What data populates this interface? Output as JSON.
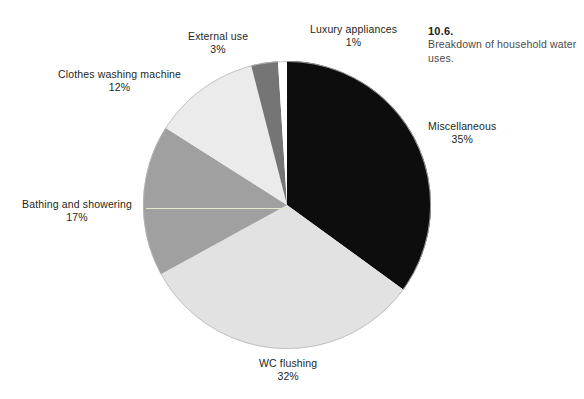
{
  "caption": {
    "number": "10.6.",
    "text": "Breakdown of household water uses."
  },
  "chart_data": {
    "type": "pie",
    "title": "Breakdown of household water uses.",
    "xlabel": "",
    "ylabel": "",
    "unit": "%",
    "total": 100,
    "start_angle_deg": 0,
    "direction": "clockwise",
    "legend_position": "none",
    "grid": false,
    "categories": [
      "Miscellaneous",
      "WC flushing",
      "Bathing and showering",
      "Clothes washing machine",
      "External use",
      "Luxury appliances"
    ],
    "values": [
      35,
      32,
      17,
      12,
      3,
      1
    ],
    "colors": [
      "#0d0d0d",
      "#e2e2e2",
      "#a0a0a0",
      "#ebebeb",
      "#757575",
      "#ffffff"
    ],
    "slices": [
      {
        "label": "Miscellaneous",
        "value": 35,
        "value_text": "35%",
        "color": "#0d0d0d",
        "start_deg": 0,
        "end_deg": 126
      },
      {
        "label": "WC flushing",
        "value": 32,
        "value_text": "32%",
        "color": "#e2e2e2",
        "start_deg": 126,
        "end_deg": 241.2
      },
      {
        "label": "Bathing and showering",
        "value": 17,
        "value_text": "17%",
        "color": "#a0a0a0",
        "start_deg": 241.2,
        "end_deg": 302.4
      },
      {
        "label": "Clothes washing machine",
        "value": 12,
        "value_text": "12%",
        "color": "#ebebeb",
        "start_deg": 302.4,
        "end_deg": 345.6
      },
      {
        "label": "External use",
        "value": 3,
        "value_text": "3%",
        "color": "#757575",
        "start_deg": 345.6,
        "end_deg": 356.4
      },
      {
        "label": "Luxury appliances",
        "value": 1,
        "value_text": "1%",
        "color": "#ffffff",
        "start_deg": 356.4,
        "end_deg": 360
      }
    ]
  },
  "labels": {
    "luxury_appliances": {
      "name": "Luxury appliances",
      "pct": "1%"
    },
    "external_use": {
      "name": "External use",
      "pct": "3%"
    },
    "clothes_washing_machine": {
      "name": "Clothes washing machine",
      "pct": "12%"
    },
    "bathing_and_showering": {
      "name": "Bathing and showering",
      "pct": "17%"
    },
    "wc_flushing": {
      "name": "WC flushing",
      "pct": "32%"
    },
    "miscellaneous": {
      "name": "Miscellaneous",
      "pct": "35%"
    }
  }
}
